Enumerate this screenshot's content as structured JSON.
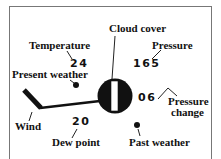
{
  "diagram": {
    "labels": {
      "cloud_cover": "Cloud cover",
      "temperature": "Temperature",
      "pressure": "Pressure",
      "present_weather": "Present weather",
      "wind": "Wind",
      "dew_point": "Dew point",
      "pressure_change_line1": "Pressure",
      "pressure_change_line2": "change",
      "past_weather": "Past weather"
    },
    "values": {
      "temperature": "24",
      "pressure": "165",
      "dew_point": "20",
      "pressure_change": "06"
    },
    "symbols": {
      "station_circle": "cloud-cover-circle",
      "wind_barb": "wind-barb",
      "present_weather": "dot",
      "past_weather": "dot",
      "pressure_tendency": "rising-then-falling"
    },
    "colors": {
      "ink": "#111111",
      "frame": "#777777",
      "background": "#ffffff"
    }
  }
}
